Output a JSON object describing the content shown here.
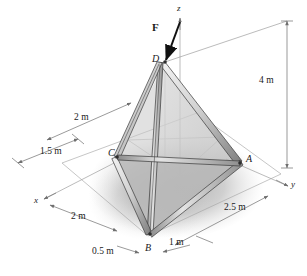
{
  "figure": {
    "type": "engineering-mechanics-diagram"
  },
  "axes": {
    "z_label": "z",
    "y_label": "y",
    "x_label": "x"
  },
  "joints": {
    "A": "A",
    "B": "B",
    "C": "C",
    "D": "D"
  },
  "load": {
    "force_label": "F"
  },
  "dimensions": {
    "height": "4 m",
    "upper_left": "2 m",
    "left": "1.5 m",
    "lower_left": "2 m",
    "bottom_left": "0.5 m",
    "bottom_right": "1 m",
    "right": "2.5 m"
  },
  "colors": {
    "ink": "#1a1a1a",
    "thin_line": "#9a9a9a",
    "member_light": "#e8e8e8",
    "member_mid": "#b4b4b4",
    "member_dark": "#6e6e6e",
    "shadow": "#b9b9b9",
    "ground": "#cccccc"
  }
}
